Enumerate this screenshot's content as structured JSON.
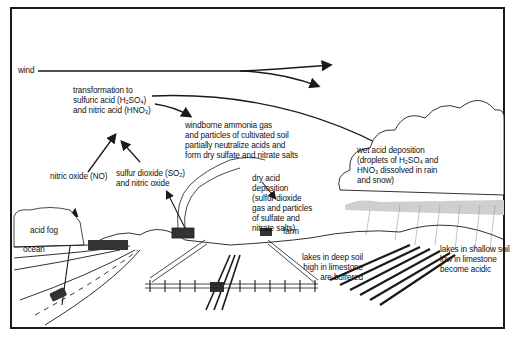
{
  "diagram": {
    "labels": {
      "wind": "wind",
      "transformation": "transformation to\nsulfuric acid (H₂SO₄)\nand nitric acid (HNO₃)",
      "ammonia": "windborne ammonia gas\nand particles of cultivated soil\npartially neutralize acids and\nform dry sulfate and nitrate salts",
      "wet_deposition": "wet acid deposition\n(droplets of H₂SO₄ and\nHNO₃ dissolved in rain\nand snow)",
      "nitric_oxide": "nitric oxide (NO)",
      "sulfur_dioxide": "sulfur dioxide (SO₂)\nand nitric oxide",
      "dry_deposition": "dry acid\ndeposition\n(sulfur dioxide\ngas and particles\nof sulfate and\nnitrate salts)",
      "acid_fog": "acid fog",
      "ocean": "ocean",
      "farm": "farm",
      "lakes_deep": "lakes in deep soil\nhigh in limestone\nare buffered",
      "lakes_shallow": "lakes in shallow soil\nlow in limestone\nbecome acidic"
    },
    "colors": {
      "ink": "#1a1a1a",
      "paper": "#ffffff",
      "shade": "#9a9a9a"
    }
  }
}
